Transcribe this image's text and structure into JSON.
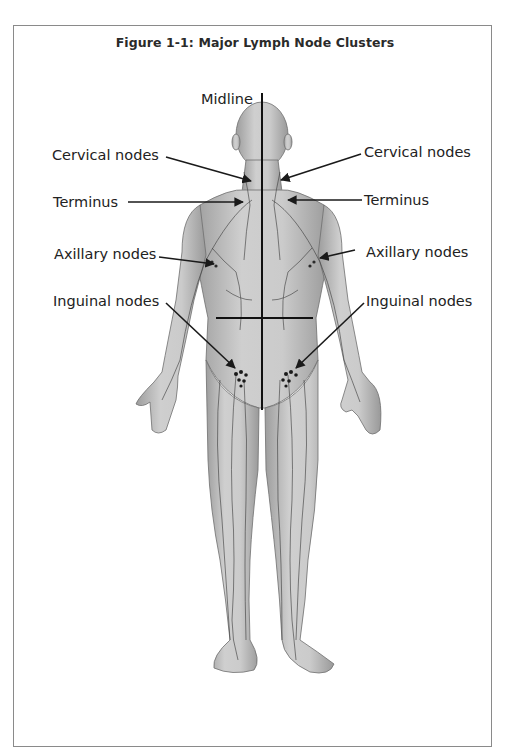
{
  "figure": {
    "title": "Figure  1-1:  Major Lymph Node Clusters",
    "image_description": "Anterior view of the human body showing the lymphatic vessels, with arrows indicating the major lymph node clusters",
    "labels": {
      "midline": "Midline",
      "cervical_left": "Cervical nodes",
      "cervical_right": "Cervical nodes",
      "terminus_left": "Terminus",
      "terminus_right": "Terminus",
      "axillary_left": "Axillary nodes",
      "axillary_right": "Axillary nodes",
      "inguinal_left": "Inguinal nodes",
      "inguinal_right": "Inguinal nodes"
    },
    "colors": {
      "border": "#8a8a8a",
      "text": "#222222",
      "body_fill": "#bdbdbd",
      "vessel": "#3a3a3a",
      "arrow": "#1a1a1a"
    }
  }
}
